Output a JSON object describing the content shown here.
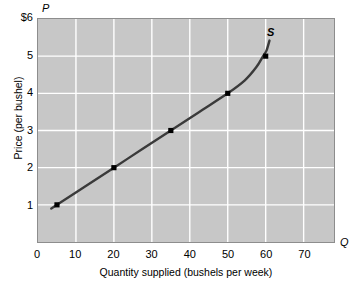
{
  "chart_data": {
    "type": "line",
    "title": "",
    "subtitle": "",
    "xlabel": "Quantity supplied (bushels per week)",
    "ylabel": "Price (per bushel)",
    "x_axis_symbol": "Q",
    "y_axis_symbol": "P",
    "xlim": [
      0,
      78
    ],
    "ylim": [
      0,
      6
    ],
    "grid": true,
    "legend_position": "none",
    "xticks": [
      {
        "value": 0,
        "label": "0"
      },
      {
        "value": 10,
        "label": "10"
      },
      {
        "value": 20,
        "label": "20"
      },
      {
        "value": 30,
        "label": "30"
      },
      {
        "value": 40,
        "label": "40"
      },
      {
        "value": 50,
        "label": "50"
      },
      {
        "value": 60,
        "label": "60"
      },
      {
        "value": 70,
        "label": "70"
      }
    ],
    "yticks": [
      {
        "value": 1,
        "label": "1"
      },
      {
        "value": 2,
        "label": "2"
      },
      {
        "value": 3,
        "label": "3"
      },
      {
        "value": 4,
        "label": "4"
      },
      {
        "value": 5,
        "label": "5"
      },
      {
        "value": 6,
        "label": "$6"
      }
    ],
    "series": [
      {
        "name": "S",
        "annotation": "S",
        "color": "#3a3a3a",
        "line_width": 2.4,
        "curve_path": [
          {
            "x": 3.5,
            "y": 0.9
          },
          {
            "x": 5,
            "y": 1.0
          },
          {
            "x": 12.5,
            "y": 1.5
          },
          {
            "x": 20,
            "y": 2.0
          },
          {
            "x": 27.5,
            "y": 2.5
          },
          {
            "x": 35,
            "y": 3.0
          },
          {
            "x": 42.5,
            "y": 3.5
          },
          {
            "x": 50,
            "y": 4.0
          },
          {
            "x": 54.5,
            "y": 4.35
          },
          {
            "x": 57.5,
            "y": 4.7
          },
          {
            "x": 59.3,
            "y": 5.0
          },
          {
            "x": 60.2,
            "y": 5.15
          },
          {
            "x": 61.0,
            "y": 5.42
          }
        ],
        "markers": [
          {
            "x": 5,
            "y": 1
          },
          {
            "x": 20,
            "y": 2
          },
          {
            "x": 35,
            "y": 3
          },
          {
            "x": 50,
            "y": 4
          },
          {
            "x": 60,
            "y": 5
          }
        ]
      }
    ],
    "colors": {
      "plot_background": "#c7c7c7",
      "gridline": "#ffffff",
      "curve": "#3a3a3a",
      "marker": "#000000",
      "panel_border": "#8d8d8d",
      "page_background": "#ffffff",
      "text": "#000000"
    }
  }
}
